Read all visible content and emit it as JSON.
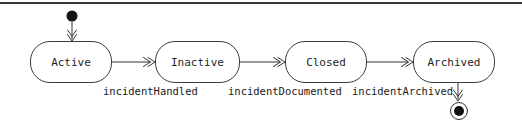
{
  "diagram": {
    "type": "uml-state-diagram",
    "background_color": "#ffffff",
    "line_color": "#333333",
    "border_color": "#3c3c3c",
    "text_color": "#1a1a1a",
    "top_rule_color": "#383838",
    "states": [
      {
        "label": "Active"
      },
      {
        "label": "Inactive"
      },
      {
        "label": "Closed"
      },
      {
        "label": "Archived"
      }
    ],
    "markers": {
      "initial": "initial-state-dot",
      "final": "final-state-ring"
    },
    "transitions": [
      {
        "from": "initial",
        "to": "Active",
        "label": ""
      },
      {
        "from": "Active",
        "to": "Inactive",
        "label": "incidentHandled"
      },
      {
        "from": "Inactive",
        "to": "Closed",
        "label": "incidentDocumented"
      },
      {
        "from": "Closed",
        "to": "Archived",
        "label": "incidentArchived"
      },
      {
        "from": "Archived",
        "to": "final",
        "label": ""
      }
    ]
  }
}
